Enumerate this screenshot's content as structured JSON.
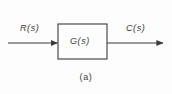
{
  "figure": {
    "caption": "(a)",
    "background_color": "#fdfdfd",
    "line_color": "#3b3b3b"
  },
  "signals": {
    "input": {
      "label": "R(s)",
      "name": "reference-input",
      "direction": "right"
    },
    "output": {
      "label": "C(s)",
      "name": "controlled-output",
      "direction": "right"
    }
  },
  "blocks": [
    {
      "label": "G(s)",
      "name": "transfer-function-block"
    }
  ]
}
